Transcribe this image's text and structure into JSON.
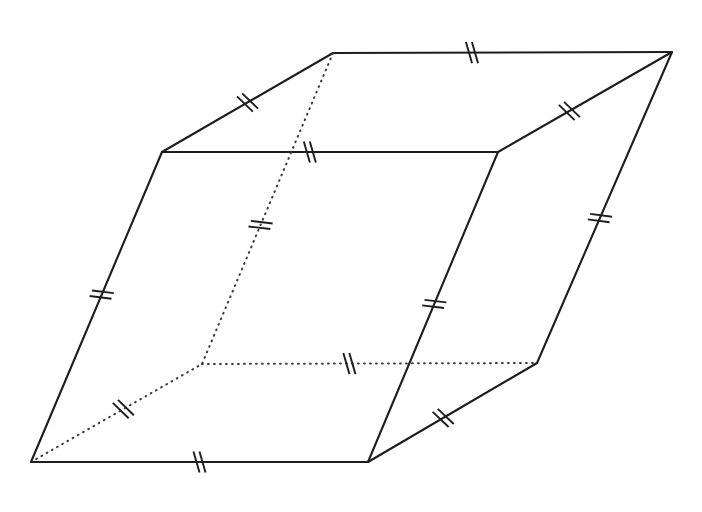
{
  "figure": {
    "canvas": {
      "width": 702,
      "height": 512
    },
    "background_color": "#ffffff",
    "solid_edge_color": "#1d1d1f",
    "hidden_edge_color": "#3a3a3c",
    "tick_color": "#1d1d1f",
    "tick_count_per_edge": 2,
    "visible_vertex_count": 7,
    "hidden_vertex_count": 1,
    "vertices": [
      {
        "id": "top-front-left",
        "label": "A",
        "x": 162,
        "y": 152,
        "hidden": false
      },
      {
        "id": "top-front-right",
        "label": "B",
        "x": 498,
        "y": 152,
        "hidden": false
      },
      {
        "id": "top-back-right",
        "label": "C",
        "x": 672,
        "y": 52,
        "hidden": false
      },
      {
        "id": "top-back-left",
        "label": "D",
        "x": 333,
        "y": 53,
        "hidden": false
      },
      {
        "id": "bottom-front-left",
        "label": "E",
        "x": 31,
        "y": 462,
        "hidden": false
      },
      {
        "id": "bottom-front-right",
        "label": "F",
        "x": 368,
        "y": 462,
        "hidden": false
      },
      {
        "id": "bottom-back-right",
        "label": "G",
        "x": 537,
        "y": 363,
        "hidden": false
      },
      {
        "id": "bottom-back-left",
        "label": "H",
        "x": 202,
        "y": 364,
        "hidden": true
      }
    ],
    "edges": [
      {
        "id": "edge-top-front",
        "from": "top-front-left",
        "to": "top-front-right",
        "style": "solid",
        "tick_at": 0.44
      },
      {
        "id": "edge-top-back",
        "from": "top-back-left",
        "to": "top-back-right",
        "style": "solid",
        "tick_at": 0.41
      },
      {
        "id": "edge-top-left",
        "from": "top-front-left",
        "to": "top-back-left",
        "style": "solid",
        "tick_at": 0.5
      },
      {
        "id": "edge-top-right",
        "from": "top-front-right",
        "to": "top-back-right",
        "style": "solid",
        "tick_at": 0.41
      },
      {
        "id": "edge-bottom-front",
        "from": "bottom-front-left",
        "to": "bottom-front-right",
        "style": "solid",
        "tick_at": 0.5
      },
      {
        "id": "edge-bottom-back",
        "from": "bottom-back-left",
        "to": "bottom-back-right",
        "style": "hidden",
        "tick_at": 0.44
      },
      {
        "id": "edge-bottom-left",
        "from": "bottom-front-left",
        "to": "bottom-back-left",
        "style": "hidden",
        "tick_at": 0.54
      },
      {
        "id": "edge-bottom-right",
        "from": "bottom-front-right",
        "to": "bottom-back-right",
        "style": "solid",
        "tick_at": 0.445
      },
      {
        "id": "edge-vert-front-left",
        "from": "top-front-left",
        "to": "bottom-front-left",
        "style": "solid",
        "tick_at": 0.46
      },
      {
        "id": "edge-vert-front-right",
        "from": "top-front-right",
        "to": "bottom-front-right",
        "style": "solid",
        "tick_at": 0.49
      },
      {
        "id": "edge-vert-back-right",
        "from": "top-back-right",
        "to": "bottom-back-right",
        "style": "solid",
        "tick_at": 0.534
      },
      {
        "id": "edge-vert-back-left",
        "from": "top-back-left",
        "to": "bottom-back-left",
        "style": "hidden",
        "tick_at": 0.553
      }
    ],
    "tick_geometry": {
      "half_length": 11,
      "separation": 6,
      "skew_degrees": 16
    }
  }
}
